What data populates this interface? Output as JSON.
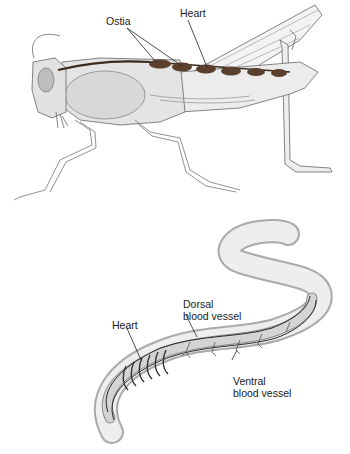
{
  "diagram": {
    "grasshopper": {
      "labels": {
        "ostia": "Ostia",
        "heart": "Heart"
      }
    },
    "earthworm": {
      "labels": {
        "heart": "Heart",
        "dorsal_line1": "Dorsal",
        "dorsal_line2": "blood vessel",
        "ventral_line1": "Ventral",
        "ventral_line2": "blood vessel"
      }
    },
    "colors": {
      "heart_fill": "#5a3f2c",
      "body_fill": "#e6e6e6",
      "outline": "#555555",
      "vessel": "#2a2a2a"
    }
  }
}
